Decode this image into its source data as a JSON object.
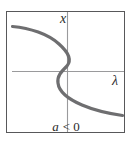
{
  "figure": {
    "kind": "bifurcation-diagram",
    "caption": "a < 0",
    "caption_parts": {
      "parameter": "a",
      "relation": "<",
      "value": "0"
    },
    "frame": {
      "border_color": "#58585a",
      "background_color": "#ffffff",
      "x": 6,
      "y": 11,
      "width": 119,
      "height": 122
    },
    "axes": {
      "vertical": {
        "label": "x",
        "color": "#9a9a9c",
        "x": 67,
        "y_top": 12,
        "y_bottom": 132,
        "label_x": 62,
        "label_y": 22
      },
      "horizontal": {
        "label": "λ",
        "color": "#9a9a9c",
        "y": 71,
        "x_left": 12,
        "x_right": 124,
        "label_x": 113,
        "label_y": 84
      },
      "origin": {
        "x": 67,
        "y": 71
      }
    },
    "curve": {
      "name": "fold-bifurcation-s-curve",
      "color": "#6e6e70",
      "stroke_width": 3.2,
      "path": "M 12.5 26.5 C 30 28 48 34 59 44 C 68 52 72 60 67 66 C 61 72 57 76 58 83 C 59 92 68 99 82 105 C 96 111 112 114 122.5 115.5",
      "points": [
        {
          "x": 12.5,
          "y": 26.5
        },
        {
          "x": 40,
          "y": 31
        },
        {
          "x": 58,
          "y": 43
        },
        {
          "x": 70,
          "y": 56
        },
        {
          "x": 67,
          "y": 71
        },
        {
          "x": 58,
          "y": 84
        },
        {
          "x": 66,
          "y": 98
        },
        {
          "x": 90,
          "y": 108
        },
        {
          "x": 122.5,
          "y": 115.5
        }
      ]
    },
    "caption_position": {
      "x": 66,
      "y": 131
    }
  }
}
